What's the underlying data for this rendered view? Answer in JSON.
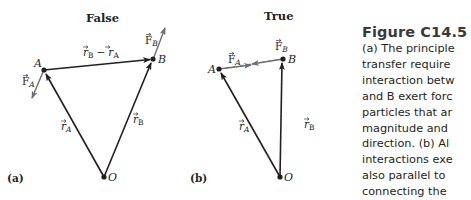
{
  "panels": [
    {
      "id": "a",
      "heading": "False",
      "panel_label": "(a)",
      "points": {
        "A": "A",
        "B": "B",
        "O": "O"
      },
      "vector_labels": {
        "r_A": "r",
        "r_A_sub": "A",
        "r_B": "r",
        "r_B_sub": "B",
        "F_A": "F",
        "F_A_sub": "A",
        "F_B": "F",
        "F_B_sub": "B",
        "diff_r1": "r",
        "diff_r1_sub": "B",
        "diff_minus": "−",
        "diff_r2": "r",
        "diff_r2_sub": "A"
      }
    },
    {
      "id": "b",
      "heading": "True",
      "panel_label": "(b)",
      "points": {
        "A": "A",
        "B": "B",
        "O": "O"
      },
      "vector_labels": {
        "r_A": "r",
        "r_A_sub": "A",
        "r_B": "r",
        "r_B_sub": "B",
        "F_A": "F",
        "F_A_sub": "A",
        "F_B": "F",
        "F_B_sub": "B"
      }
    }
  ],
  "caption": {
    "title": "Figure C14.5",
    "lines": [
      "(a) The principle",
      "transfer require",
      "interaction betw",
      "and B exert forc",
      "particles that ar",
      "magnitude and",
      "direction. (b) Al",
      "interactions exe",
      "also parallel to",
      "connecting the"
    ]
  },
  "colors": {
    "line": "#231f20",
    "force_arrow": "#6d6e71",
    "dashed": "#8a8a8a",
    "text": "#231f20"
  }
}
